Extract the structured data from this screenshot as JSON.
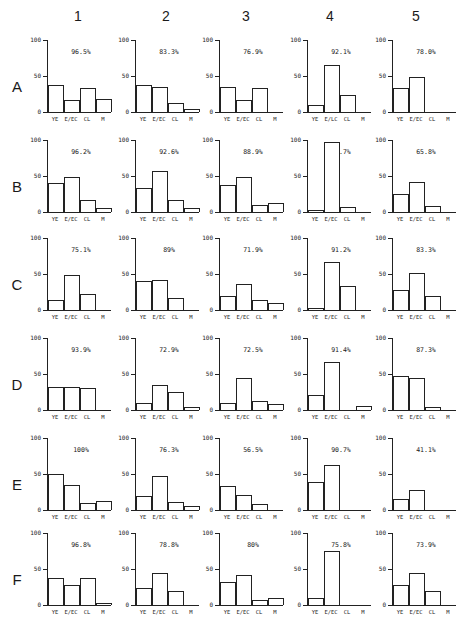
{
  "chart_data": {
    "type": "bar",
    "layout": "grid 6 rows x 5 columns of small-multiple bar charts",
    "columns": [
      "1",
      "2",
      "3",
      "4",
      "5"
    ],
    "rows": [
      "A",
      "B",
      "C",
      "D",
      "E",
      "F"
    ],
    "categories": [
      "YE",
      "E/EC",
      "CL",
      "M"
    ],
    "ylim": [
      0,
      100
    ],
    "yticks": [
      "0",
      "50",
      "100"
    ],
    "grid": false,
    "panels": [
      {
        "row": "A",
        "col": "1",
        "pct": "96.5%",
        "values": [
          38,
          16,
          34,
          18
        ]
      },
      {
        "row": "A",
        "col": "2",
        "pct": "83.3%",
        "values": [
          38,
          35,
          13,
          4
        ]
      },
      {
        "row": "A",
        "col": "3",
        "pct": "76.9%",
        "values": [
          35,
          16,
          34,
          0
        ]
      },
      {
        "row": "A",
        "col": "4",
        "pct": "92.1%",
        "values": [
          10,
          65,
          24,
          0
        ],
        "xlabels": [
          "YE",
          "E/LC",
          "CL",
          "M"
        ]
      },
      {
        "row": "A",
        "col": "5",
        "pct": "78.0%",
        "values": [
          34,
          48,
          0,
          0
        ]
      },
      {
        "row": "B",
        "col": "1",
        "pct": "96.2%",
        "values": [
          40,
          48,
          17,
          6
        ]
      },
      {
        "row": "B",
        "col": "2",
        "pct": "92.6%",
        "values": [
          33,
          57,
          17,
          5
        ]
      },
      {
        "row": "B",
        "col": "3",
        "pct": "88.9%",
        "values": [
          37,
          48,
          10,
          13
        ]
      },
      {
        "row": "B",
        "col": "4",
        "pct": "96.7%",
        "values": [
          3,
          97,
          7,
          0
        ]
      },
      {
        "row": "B",
        "col": "5",
        "pct": "65.8%",
        "values": [
          25,
          42,
          9,
          0
        ]
      },
      {
        "row": "C",
        "col": "1",
        "pct": "75.1%",
        "values": [
          14,
          48,
          22,
          0
        ]
      },
      {
        "row": "C",
        "col": "2",
        "pct": "89%",
        "values": [
          40,
          42,
          17,
          0
        ]
      },
      {
        "row": "C",
        "col": "3",
        "pct": "71.9%",
        "values": [
          20,
          36,
          14,
          10
        ]
      },
      {
        "row": "C",
        "col": "4",
        "pct": "91.2%",
        "values": [
          3,
          67,
          34,
          0
        ]
      },
      {
        "row": "C",
        "col": "5",
        "pct": "83.3%",
        "values": [
          28,
          52,
          19,
          0
        ]
      },
      {
        "row": "D",
        "col": "1",
        "pct": "93.9%",
        "values": [
          32,
          32,
          31,
          0
        ]
      },
      {
        "row": "D",
        "col": "2",
        "pct": "72.9%",
        "values": [
          10,
          35,
          25,
          4
        ]
      },
      {
        "row": "D",
        "col": "3",
        "pct": "72.5%",
        "values": [
          10,
          45,
          12,
          8
        ]
      },
      {
        "row": "D",
        "col": "4",
        "pct": "91.4%",
        "values": [
          21,
          67,
          0,
          5
        ]
      },
      {
        "row": "D",
        "col": "5",
        "pct": "87.3%",
        "values": [
          47,
          44,
          4,
          0
        ]
      },
      {
        "row": "E",
        "col": "1",
        "pct": "100%",
        "values": [
          50,
          35,
          10,
          13
        ]
      },
      {
        "row": "E",
        "col": "2",
        "pct": "76.3%",
        "values": [
          20,
          47,
          11,
          6
        ]
      },
      {
        "row": "E",
        "col": "3",
        "pct": "56.5%",
        "values": [
          33,
          21,
          9,
          0
        ]
      },
      {
        "row": "E",
        "col": "4",
        "pct": "90.7%",
        "values": [
          39,
          62,
          0,
          0
        ]
      },
      {
        "row": "E",
        "col": "5",
        "pct": "41.1%",
        "values": [
          15,
          28,
          0,
          0
        ]
      },
      {
        "row": "F",
        "col": "1",
        "pct": "96.8%",
        "values": [
          37,
          28,
          37,
          3
        ]
      },
      {
        "row": "F",
        "col": "2",
        "pct": "78.8%",
        "values": [
          24,
          44,
          20,
          0
        ]
      },
      {
        "row": "F",
        "col": "3",
        "pct": "80%",
        "values": [
          32,
          42,
          7,
          10
        ]
      },
      {
        "row": "F",
        "col": "4",
        "pct": "75.8%",
        "values": [
          10,
          75,
          0,
          0
        ]
      },
      {
        "row": "F",
        "col": "5",
        "pct": "73.9%",
        "values": [
          28,
          44,
          19,
          0
        ]
      }
    ]
  }
}
